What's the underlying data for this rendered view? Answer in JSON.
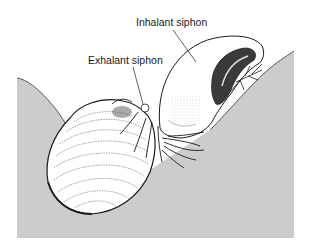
{
  "figure": {
    "labels": [
      {
        "id": "inhalant",
        "text": "Inhalant siphon"
      },
      {
        "id": "exhalant",
        "text": "Exhalant siphon"
      }
    ],
    "colors": {
      "background": "#ffffff",
      "sediment": "#cccccc",
      "outline": "#1a1a1a",
      "shell": "#ffffff",
      "shade": "#555555"
    }
  }
}
